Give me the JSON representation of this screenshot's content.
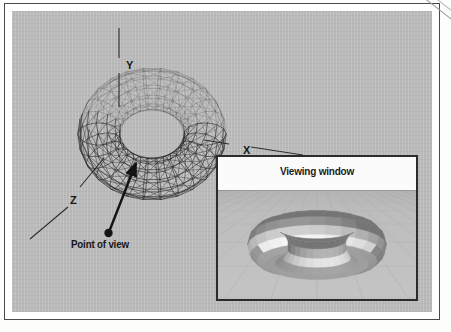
{
  "figure": {
    "background_color": "#b9b9b9",
    "ink_color": "#1a1a1a"
  },
  "axes": {
    "y": {
      "label": "Y",
      "description": "vertical dashed axis above torus"
    },
    "x": {
      "label": "X",
      "description": "dashed axis to the right of torus"
    },
    "z": {
      "label": "Z",
      "description": "dashed axis to the lower left of torus"
    }
  },
  "annotations": {
    "point_of_view": {
      "label": "Point of view",
      "marker": "filled-dot",
      "arrow": "arrow-to-torus-surface"
    }
  },
  "inset": {
    "title": "Viewing window",
    "sky_color": "#fbfbfb",
    "ground_color": "#bdbdbd",
    "border_color": "#2b2b2b",
    "content": "shaded faceted torus seen from the point of view"
  },
  "objects": {
    "wireframe_torus": {
      "name": "torus",
      "render_style": "triangulated wireframe",
      "major_segments": 24,
      "minor_segments": 12
    },
    "shaded_torus": {
      "name": "torus",
      "render_style": "flat-shaded facets",
      "major_segments": 24,
      "minor_segments": 12
    }
  }
}
